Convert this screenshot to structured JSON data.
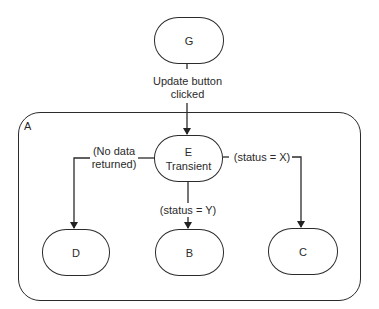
{
  "diagram": {
    "container": {
      "id": "A",
      "label": "A"
    },
    "nodes": {
      "G": {
        "label": "G"
      },
      "E": {
        "label": "E",
        "sublabel": "Transient"
      },
      "D": {
        "label": "D"
      },
      "B": {
        "label": "B"
      },
      "C": {
        "label": "C"
      }
    },
    "edges": [
      {
        "from": "G",
        "to": "E",
        "label_line1": "Update button",
        "label_line2": "clicked"
      },
      {
        "from": "E",
        "to": "D",
        "label_line1": "(No data",
        "label_line2": "returned)"
      },
      {
        "from": "E",
        "to": "B",
        "label": "(status = Y)"
      },
      {
        "from": "E",
        "to": "C",
        "label": "(status = X)"
      }
    ]
  }
}
